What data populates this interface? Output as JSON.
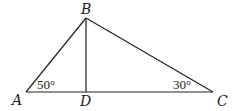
{
  "figure": {
    "type": "triangle-with-altitude",
    "points": {
      "A": {
        "label": "A",
        "x": 26,
        "y": 92
      },
      "B": {
        "label": "B",
        "x": 86,
        "y": 18
      },
      "C": {
        "label": "C",
        "x": 213,
        "y": 92
      },
      "D": {
        "label": "D",
        "x": 86,
        "y": 92
      }
    },
    "segments": [
      "AB",
      "BC",
      "AC",
      "BD"
    ],
    "angles": {
      "A": {
        "text": "50°"
      },
      "C": {
        "text": "30°"
      }
    },
    "colors": {
      "stroke": "#222222",
      "text": "#1a1a1a",
      "background": "#ffffff"
    }
  }
}
